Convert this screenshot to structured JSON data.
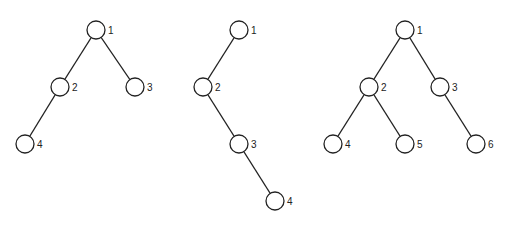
{
  "diagram": {
    "type": "binary-trees",
    "trees": [
      {
        "name": "tree-1",
        "nodes": [
          {
            "id": "1",
            "label": "1",
            "x": 96,
            "y": 30
          },
          {
            "id": "2",
            "label": "2",
            "x": 60,
            "y": 87
          },
          {
            "id": "3",
            "label": "3",
            "x": 135,
            "y": 87
          },
          {
            "id": "4",
            "label": "4",
            "x": 25,
            "y": 144
          }
        ],
        "edges": [
          [
            "1",
            "2"
          ],
          [
            "1",
            "3"
          ],
          [
            "2",
            "4"
          ]
        ]
      },
      {
        "name": "tree-2",
        "nodes": [
          {
            "id": "1",
            "label": "1",
            "x": 239,
            "y": 30
          },
          {
            "id": "2",
            "label": "2",
            "x": 203,
            "y": 87
          },
          {
            "id": "3",
            "label": "3",
            "x": 239,
            "y": 144
          },
          {
            "id": "4",
            "label": "4",
            "x": 275,
            "y": 201
          }
        ],
        "edges": [
          [
            "1",
            "2"
          ],
          [
            "2",
            "3"
          ],
          [
            "3",
            "4"
          ]
        ]
      },
      {
        "name": "tree-3",
        "nodes": [
          {
            "id": "1",
            "label": "1",
            "x": 405,
            "y": 30
          },
          {
            "id": "2",
            "label": "2",
            "x": 369,
            "y": 87
          },
          {
            "id": "3",
            "label": "3",
            "x": 440,
            "y": 87
          },
          {
            "id": "4",
            "label": "4",
            "x": 333,
            "y": 144
          },
          {
            "id": "5",
            "label": "5",
            "x": 405,
            "y": 144
          },
          {
            "id": "6",
            "label": "6",
            "x": 476,
            "y": 144
          }
        ],
        "edges": [
          [
            "1",
            "2"
          ],
          [
            "1",
            "3"
          ],
          [
            "2",
            "4"
          ],
          [
            "2",
            "5"
          ],
          [
            "3",
            "6"
          ]
        ]
      }
    ]
  }
}
